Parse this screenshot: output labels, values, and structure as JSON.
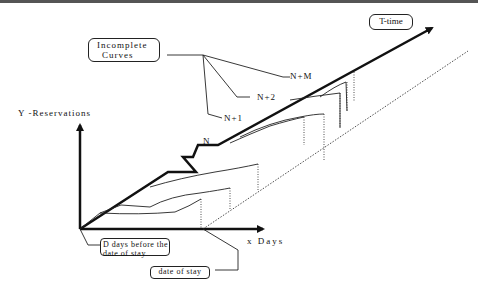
{
  "diagram": {
    "labels": {
      "incomplete_curves_line1": "Incomplete",
      "incomplete_curves_line2": "Curves",
      "t_time": "T-time",
      "y_axis": "Y -Reservations",
      "x_axis": "x  Days",
      "n": "N",
      "n_plus_1": "N+1",
      "n_plus_2": "N+2",
      "n_plus_m": "N+M",
      "d_days_line1": "D days before the",
      "d_days_line2": "date of stay",
      "date_of_stay": "date of stay"
    },
    "colors": {
      "ink": "#111111",
      "background": "#ffffff",
      "top_rule": "#555555"
    }
  }
}
